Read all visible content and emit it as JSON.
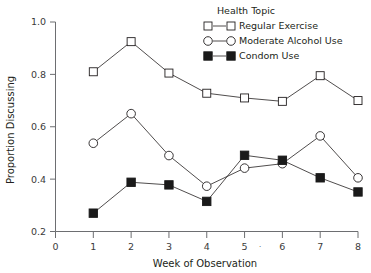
{
  "chart_data": {
    "type": "line",
    "title": "",
    "xlabel": "Week of Observation",
    "ylabel": "Proportion Discussing",
    "x": [
      1,
      2,
      3,
      4,
      5,
      6,
      7,
      8
    ],
    "xticks": [
      "0",
      "1",
      "2",
      "3",
      "4",
      "5",
      "6",
      "7",
      "8"
    ],
    "yticks": [
      "0.2",
      "0.4",
      "0.6",
      "0.8",
      "1.0"
    ],
    "xlim": [
      0,
      8
    ],
    "ylim": [
      0.2,
      1.0
    ],
    "grid": false,
    "legend_position": "top-right",
    "legend_title": "Health Topic",
    "annotation_after_tick5": "·",
    "series": [
      {
        "name": "Regular Exercise",
        "marker": "open-square",
        "values": [
          0.81,
          0.925,
          0.805,
          0.728,
          0.71,
          0.697,
          0.795,
          0.7
        ]
      },
      {
        "name": "Moderate Alcohol Use",
        "marker": "open-circle",
        "values": [
          0.537,
          0.65,
          0.49,
          0.373,
          0.442,
          0.459,
          0.565,
          0.405
        ]
      },
      {
        "name": "Condom Use",
        "marker": "filled-square",
        "values": [
          0.27,
          0.388,
          0.378,
          0.315,
          0.491,
          0.472,
          0.405,
          0.351
        ]
      }
    ]
  },
  "colors": {
    "ink": "#231f20",
    "axis": "#6d6e71",
    "marker_fill": "#ffffff",
    "marker_filled": "#1a1a1a",
    "background": "#ffffff"
  }
}
